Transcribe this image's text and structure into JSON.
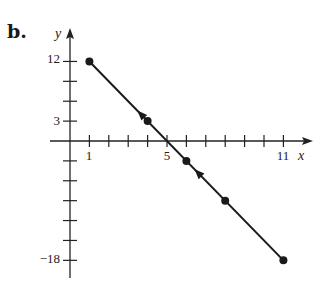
{
  "panel_label": "b.",
  "chart_data": {
    "type": "line",
    "title": "",
    "xlabel": "x",
    "ylabel": "y",
    "equation": "y = -3x + 15",
    "x": [
      1,
      4,
      6,
      8,
      11
    ],
    "values": [
      12,
      3,
      -3,
      -9,
      -18
    ],
    "series": [
      {
        "name": "line",
        "x": [
          1,
          4,
          6,
          8,
          11
        ],
        "values": [
          12,
          3,
          -3,
          -9,
          -18
        ]
      }
    ],
    "x_intercept": 5,
    "xlim": [
      0,
      11.8
    ],
    "ylim": [
      -21,
      15
    ],
    "x_ticks": [
      1,
      2,
      3,
      4,
      5,
      6,
      7,
      8,
      9,
      10,
      11
    ],
    "x_tick_labels": [
      "1",
      "5",
      "11"
    ],
    "y_ticks": [
      12,
      9,
      6,
      3,
      -3,
      -6,
      -9,
      -12,
      -15,
      -18
    ],
    "y_tick_labels": [
      "12",
      "3",
      "−18"
    ],
    "direction_arrows": "pointing toward upper-left (decreasing x)",
    "grid": false,
    "legend": null
  },
  "labels": {
    "x_axis": "x",
    "y_axis": "y",
    "x1": "1",
    "x5": "5",
    "x11": "11",
    "y12": "12",
    "y3": "3",
    "yneg18": "−18"
  }
}
